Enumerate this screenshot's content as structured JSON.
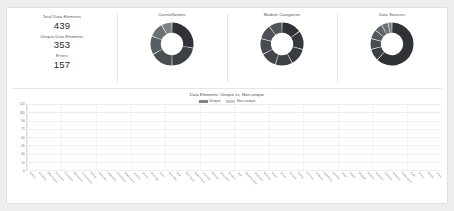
{
  "theme": {
    "page_bg": "#eceef0",
    "card_bg": "#ffffff",
    "border": "#dcdfe3",
    "unique_color": "#7e838a",
    "nonunique_color": "#c9ccd0",
    "donut_dark": "#2f3337",
    "donut_mid": "#4c5156",
    "donut_light": "#8d9298"
  },
  "kpis": [
    {
      "label": "Total Data Elements",
      "value": "439"
    },
    {
      "label": "Unique Data Elements",
      "value": "353"
    },
    {
      "label": "Errors",
      "value": "157"
    }
  ],
  "donuts": [
    {
      "title": "Constellations",
      "chart_data": {
        "type": "pie",
        "title": "Constellations",
        "labels": [
          "Segment 1",
          "Segment 2",
          "Segment 3",
          "Segment 4",
          "Segment 5",
          "Segment 6"
        ],
        "values": [
          28,
          22,
          17,
          14,
          11,
          8
        ],
        "colors": [
          "#2f3337",
          "#3c4145",
          "#4a4f54",
          "#595e63",
          "#6b7075",
          "#7d8288"
        ],
        "legend": "none",
        "hole": 0.52
      }
    },
    {
      "title": "Module Categories",
      "chart_data": {
        "type": "pie",
        "title": "Module Categories",
        "labels": [
          "Cat 1",
          "Cat 2",
          "Cat 3",
          "Cat 4",
          "Cat 5",
          "Cat 6",
          "Cat 7",
          "Cat 8"
        ],
        "values": [
          15,
          14,
          13,
          13,
          12,
          12,
          11,
          10
        ],
        "colors": [
          "#2f3337",
          "#34383c",
          "#393d42",
          "#3e4247",
          "#43474c",
          "#484c51",
          "#4d5156",
          "#52565b"
        ],
        "legend": "none",
        "hole": 0.52
      }
    },
    {
      "title": "Data Sources",
      "chart_data": {
        "type": "pie",
        "title": "Data Sources",
        "labels": [
          "Source 1",
          "Source 2",
          "Source 3",
          "Source 4",
          "Source 5",
          "Source 6",
          "Source 7"
        ],
        "values": [
          62,
          9,
          8,
          7,
          6,
          5,
          3
        ],
        "colors": [
          "#2f3337",
          "#3b4044",
          "#474c51",
          "#53585d",
          "#5f646a",
          "#6b7076",
          "#787d83"
        ],
        "legend": "none",
        "hole": 0.52
      }
    }
  ],
  "bar_chart": {
    "title": "Data Elements: Unique vs. Non-unique",
    "legend": [
      {
        "label": "Unique",
        "color": "#7e838a"
      },
      {
        "label": "Non-unique",
        "color": "#c9ccd0"
      }
    ]
  },
  "chart_data": {
    "type": "bar",
    "title": "Data Elements: Unique vs. Non-unique",
    "xlabel": "",
    "ylabel": "",
    "ylim": [
      0,
      120
    ],
    "yticks": [
      0,
      15,
      30,
      45,
      60,
      75,
      90,
      105,
      120
    ],
    "grid": true,
    "stacked": true,
    "legend_position": "top",
    "categories": [
      "Patient",
      "Condition",
      "Observation",
      "Encounter",
      "Procedure",
      "Medication",
      "Immunization",
      "Allergy",
      "Specimen",
      "Diagnostic",
      "Practitioner",
      "Organization",
      "Location",
      "Device",
      "Coverage",
      "Claim",
      "Care Plan",
      "Goal",
      "Care Team",
      "Appointment",
      "Schedule",
      "Referral",
      "Document",
      "Consent",
      "Task",
      "Questionnaire",
      "Response",
      "Measure",
      "Report",
      "Group",
      "Account",
      "Invoice",
      "Contract",
      "Endpoint",
      "Substance",
      "Nutrition",
      "Vision",
      "Supply",
      "Request",
      "Delivery",
      "Research",
      "Evidence",
      "Guidance",
      "Subscription",
      "Audit",
      "Binary",
      "Bundle",
      "Linkage"
    ],
    "series": [
      {
        "name": "Unique",
        "color": "#7e838a",
        "values": [
          98,
          41,
          39,
          33,
          20,
          27,
          19,
          17,
          14,
          12,
          11,
          10,
          9,
          8,
          12,
          7,
          6,
          5,
          5,
          4,
          4,
          3,
          3,
          3,
          2,
          2,
          2,
          2,
          2,
          1,
          1,
          1,
          1,
          1,
          1,
          1,
          1,
          1,
          1,
          1,
          1,
          1,
          1,
          1,
          0,
          0,
          0,
          0
        ]
      },
      {
        "name": "Non-unique",
        "color": "#c9ccd0",
        "values": [
          17,
          3,
          3,
          3,
          10,
          2,
          2,
          2,
          2,
          2,
          2,
          2,
          2,
          2,
          3,
          1,
          1,
          1,
          1,
          1,
          1,
          1,
          1,
          1,
          1,
          1,
          1,
          1,
          1,
          1,
          1,
          1,
          1,
          1,
          1,
          1,
          1,
          1,
          0,
          0,
          0,
          0,
          0,
          0,
          0,
          0,
          0,
          0
        ]
      }
    ]
  }
}
